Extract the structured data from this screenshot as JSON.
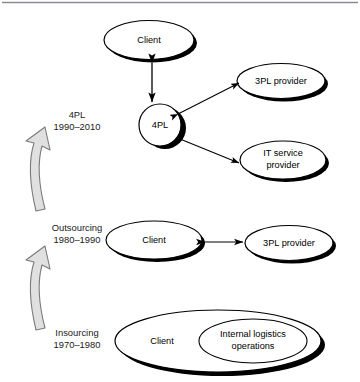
{
  "figure": {
    "top_rule": true,
    "background_color": "#ffffff",
    "line_color": "#000000",
    "shadow_color": "#000000",
    "arrow_fill_color": "#e0e0e0",
    "arrow_stroke_color": "#7a7a7a"
  },
  "stages": [
    {
      "id": "4pl",
      "name": "4PL",
      "period": "1990–2010"
    },
    {
      "id": "outsourcing",
      "name": "Outsourcing",
      "period": "1980–1990"
    },
    {
      "id": "insourcing",
      "name": "Insourcing",
      "period": "1970–1980"
    }
  ],
  "nodes": {
    "top_client": "Client",
    "fourpl": "4PL",
    "threepl_top": "3PL provider",
    "it_service_line1": "IT service",
    "it_service_line2": "provider",
    "mid_client": "Client",
    "threepl_mid": "3PL provider",
    "bottom_client": "Client",
    "internal_line1": "Internal logistics",
    "internal_line2": "operations"
  },
  "connections": [
    {
      "from": "top_client",
      "to": "fourpl",
      "type": "double-arrow"
    },
    {
      "from": "fourpl",
      "to": "threepl_top",
      "type": "double-arrow"
    },
    {
      "from": "fourpl",
      "to": "it_service",
      "type": "single-arrow"
    },
    {
      "from": "mid_client",
      "to": "threepl_mid",
      "type": "double-arrow"
    }
  ],
  "progression_arrows": [
    {
      "id": "arrow-insourcing-to-outsourcing",
      "direction": "up"
    },
    {
      "id": "arrow-outsourcing-to-4pl",
      "direction": "up"
    }
  ]
}
